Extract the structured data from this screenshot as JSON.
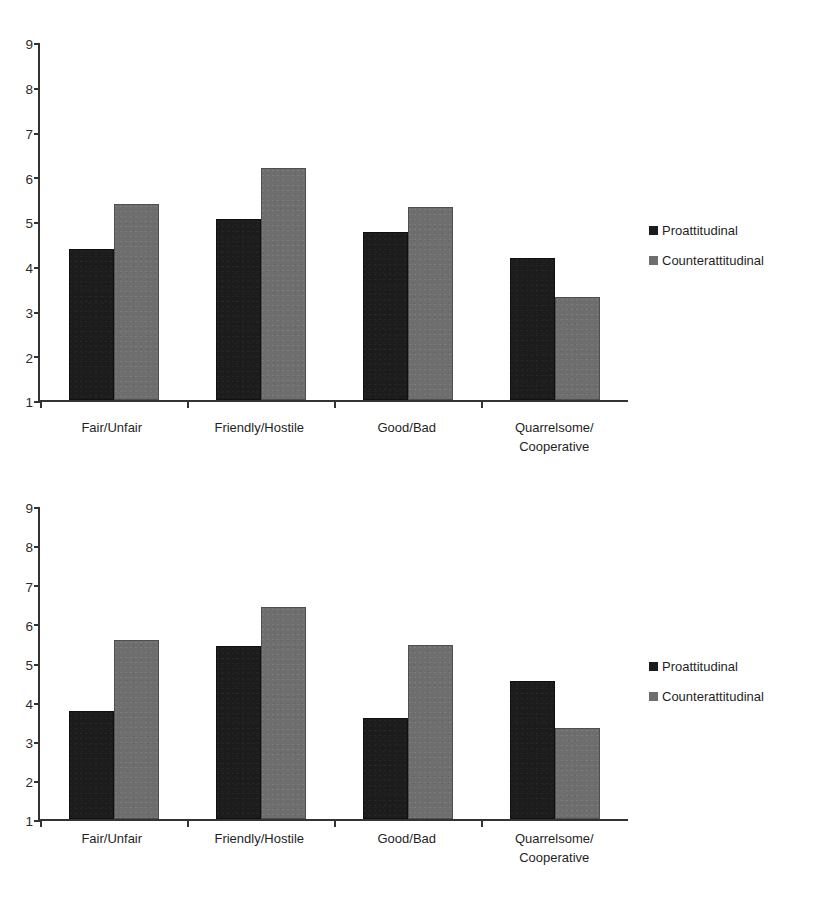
{
  "chart_data": [
    {
      "type": "bar",
      "title": "",
      "xlabel": "",
      "ylabel": "",
      "ylim": [
        1,
        9
      ],
      "yticks": [
        9,
        8,
        7,
        6,
        5,
        4,
        3,
        2,
        1
      ],
      "grid": false,
      "legend_position": "right",
      "categories": [
        "Fair/Unfair",
        "Friendly/Hostile",
        "Good/Bad",
        "Quarrelsome/\nCooperative"
      ],
      "series": [
        {
          "name": "Proattitudinal",
          "color": "#1c1c1c",
          "values": [
            4.37,
            5.05,
            4.75,
            4.18
          ]
        },
        {
          "name": "Counterattitudinal",
          "color": "#6e6e6e",
          "values": [
            5.39,
            6.19,
            5.32,
            3.31
          ]
        }
      ]
    },
    {
      "type": "bar",
      "title": "",
      "xlabel": "",
      "ylabel": "",
      "ylim": [
        1,
        9
      ],
      "yticks": [
        9,
        8,
        7,
        6,
        5,
        4,
        3,
        2,
        1
      ],
      "grid": false,
      "legend_position": "right",
      "categories": [
        "Fair/Unfair",
        "Friendly/Hostile",
        "Good/Bad",
        "Quarrelsome/\nCooperative"
      ],
      "series": [
        {
          "name": "Proattitudinal",
          "color": "#1c1c1c",
          "values": [
            3.77,
            5.41,
            3.58,
            4.53
          ]
        },
        {
          "name": "Counterattitudinal",
          "color": "#6e6e6e",
          "values": [
            5.57,
            6.41,
            5.44,
            3.32
          ]
        }
      ]
    }
  ]
}
